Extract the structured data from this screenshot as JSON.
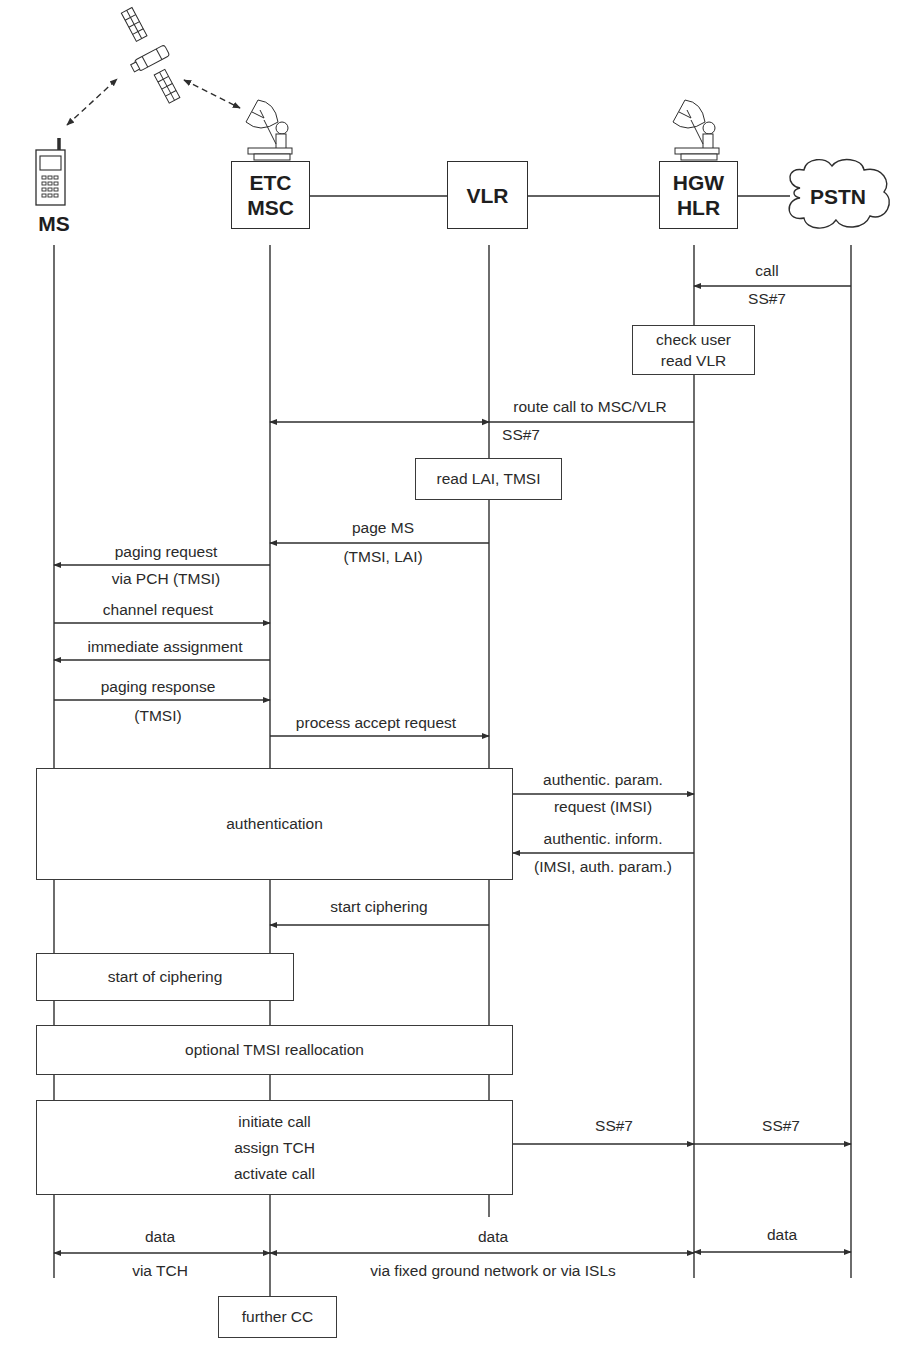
{
  "diagram": {
    "type": "sequence",
    "actors": [
      {
        "id": "ms",
        "label": "MS",
        "icon": "mobile-phone-icon",
        "x": 54
      },
      {
        "id": "etc_msc",
        "label_lines": [
          "ETC",
          "MSC"
        ],
        "icon": "satellite-dish-icon",
        "x": 270
      },
      {
        "id": "vlr",
        "label_lines": [
          "VLR"
        ],
        "x": 489
      },
      {
        "id": "hgw_hlr",
        "label_lines": [
          "HGW",
          "HLR"
        ],
        "icon": "satellite-dish-icon",
        "x": 694
      },
      {
        "id": "pstn",
        "label": "PSTN",
        "shape": "cloud",
        "x": 851
      }
    ],
    "satellite": {
      "icon": "satellite-icon",
      "links": [
        "MS <-> satellite",
        "satellite <-> ETC/MSC"
      ]
    },
    "messages": [
      {
        "from": "PSTN",
        "to": "HGW/HLR",
        "above": "call",
        "below": "SS#7"
      },
      {
        "from": "HGW/HLR",
        "to": "ETC/MSC",
        "above": "route call to MSC/VLR",
        "below": "SS#7"
      },
      {
        "from": "VLR",
        "to": "ETC/MSC",
        "above": "page MS",
        "below": "(TMSI, LAI)"
      },
      {
        "from": "ETC/MSC",
        "to": "MS",
        "above": "paging request",
        "below": "via PCH (TMSI)"
      },
      {
        "from": "MS",
        "to": "ETC/MSC",
        "above": "channel request"
      },
      {
        "from": "ETC/MSC",
        "to": "MS",
        "above": "immediate assignment"
      },
      {
        "from": "MS",
        "to": "ETC/MSC",
        "above": "paging response",
        "below": "(TMSI)"
      },
      {
        "from": "ETC/MSC",
        "to": "VLR",
        "above": "process accept request"
      },
      {
        "from": "VLR",
        "to": "HGW/HLR",
        "above": "authentic. param.",
        "below": "request (IMSI)"
      },
      {
        "from": "HGW/HLR",
        "to": "VLR",
        "above": "authentic. inform.",
        "below": "(IMSI, auth. param.)"
      },
      {
        "from": "VLR",
        "to": "ETC/MSC",
        "above": "start ciphering"
      },
      {
        "from": "VLR",
        "to": "HGW/HLR",
        "above": "SS#7"
      },
      {
        "from": "HGW/HLR",
        "to": "PSTN",
        "above": "SS#7"
      },
      {
        "from": "MS",
        "to": "ETC/MSC",
        "bidirectional": true,
        "above": "data",
        "below": "via TCH"
      },
      {
        "from": "ETC/MSC",
        "to": "HGW/HLR",
        "bidirectional": true,
        "above": "data",
        "below": "via fixed ground network or via ISLs"
      },
      {
        "from": "HGW/HLR",
        "to": "PSTN",
        "bidirectional": true,
        "above": "data"
      }
    ],
    "process_boxes": [
      {
        "id": "check_user",
        "lines": [
          "check user",
          "read VLR"
        ]
      },
      {
        "id": "read_lai",
        "lines": [
          "read LAI, TMSI"
        ]
      },
      {
        "id": "authentication",
        "lines": [
          "authentication"
        ]
      },
      {
        "id": "start_of_ciphering",
        "lines": [
          "start of ciphering"
        ]
      },
      {
        "id": "tmsi_realloc",
        "lines": [
          "optional TMSI reallocation"
        ]
      },
      {
        "id": "initiate_call",
        "lines": [
          "initiate call",
          "assign TCH",
          "activate call"
        ]
      },
      {
        "id": "further_cc",
        "lines": [
          "further CC"
        ]
      }
    ],
    "colors": {
      "line": "#2e2e2e",
      "text": "#2a2a2a",
      "background": "#ffffff"
    }
  }
}
